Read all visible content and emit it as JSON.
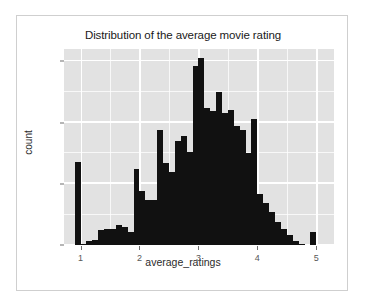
{
  "chart_data": {
    "type": "bar",
    "title": "Distribution of the average movie rating",
    "xlabel": "average_ratings",
    "ylabel": "count",
    "xlim": [
      0.72,
      5.3
    ],
    "ylim": [
      0,
      160
    ],
    "grid": true,
    "legend": null,
    "bin_width": 0.1,
    "x_ticks": [
      "1",
      "2",
      "3",
      "4",
      "5"
    ],
    "x_tick_values": [
      1,
      2,
      3,
      4,
      5
    ],
    "y_ticks": [
      "0",
      "50",
      "100",
      "150"
    ],
    "y_tick_values": [
      0,
      50,
      100,
      150
    ],
    "bar_color": "#111111",
    "panel_color": "#e2e2e2",
    "grid_color": "#ffffff",
    "x": [
      0.95,
      1.05,
      1.15,
      1.25,
      1.35,
      1.45,
      1.55,
      1.65,
      1.75,
      1.85,
      1.95,
      2.05,
      2.15,
      2.25,
      2.35,
      2.45,
      2.55,
      2.65,
      2.75,
      2.85,
      2.95,
      3.05,
      3.15,
      3.25,
      3.35,
      3.45,
      3.55,
      3.65,
      3.75,
      3.85,
      3.95,
      4.05,
      4.15,
      4.25,
      4.35,
      4.45,
      4.55,
      4.65,
      4.75,
      4.85,
      4.95,
      5.05
    ],
    "values": [
      68,
      1,
      3,
      4,
      12,
      13,
      13,
      16,
      15,
      11,
      62,
      44,
      37,
      37,
      94,
      67,
      60,
      85,
      89,
      76,
      146,
      153,
      112,
      109,
      125,
      108,
      110,
      97,
      94,
      75,
      103,
      42,
      34,
      27,
      19,
      13,
      8,
      3,
      1,
      0,
      11,
      0
    ],
    "categories": [
      "1.0",
      "1.1",
      "1.2",
      "1.3",
      "1.4",
      "1.5",
      "1.6",
      "1.7",
      "1.8",
      "1.9",
      "2.0",
      "2.1",
      "2.2",
      "2.3",
      "2.4",
      "2.5",
      "2.6",
      "2.7",
      "2.8",
      "2.9",
      "3.0",
      "3.1",
      "3.2",
      "3.3",
      "3.4",
      "3.5",
      "3.6",
      "3.7",
      "3.8",
      "3.9",
      "4.0",
      "4.1",
      "4.2",
      "4.3",
      "4.4",
      "4.5",
      "4.6",
      "4.7",
      "4.8",
      "4.9",
      "5.0",
      "5.1"
    ],
    "minor_x_values": [
      1.5,
      2.5,
      3.5,
      4.5
    ],
    "minor_y_values": [
      25,
      75,
      125
    ]
  }
}
